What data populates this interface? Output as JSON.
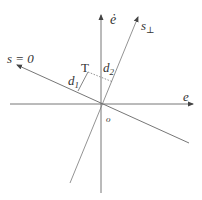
{
  "diagram": {
    "title": "",
    "labels": {
      "e_dot": "ė",
      "s_perp": "s",
      "s_perp_sub": "⊥",
      "s_zero": "s = 0",
      "T": "T",
      "d1": "d",
      "d1_sub": "1",
      "d2": "d",
      "d2_sub": "2",
      "e": "e",
      "origin": "o"
    },
    "colors": {
      "line": "#555555",
      "text": "#333333",
      "background": "#ffffff"
    }
  }
}
